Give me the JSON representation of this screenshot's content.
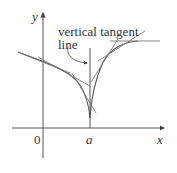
{
  "figure": {
    "annotation": {
      "line1": "vertical tangent",
      "line2": "line"
    },
    "axes": {
      "x_label": "x",
      "y_label": "y",
      "origin_label": "0",
      "tick_label_a": "a"
    },
    "colors": {
      "axis": "#444444",
      "curve": "#555555",
      "tangent": "#7a7a7a",
      "text": "#333333"
    }
  }
}
